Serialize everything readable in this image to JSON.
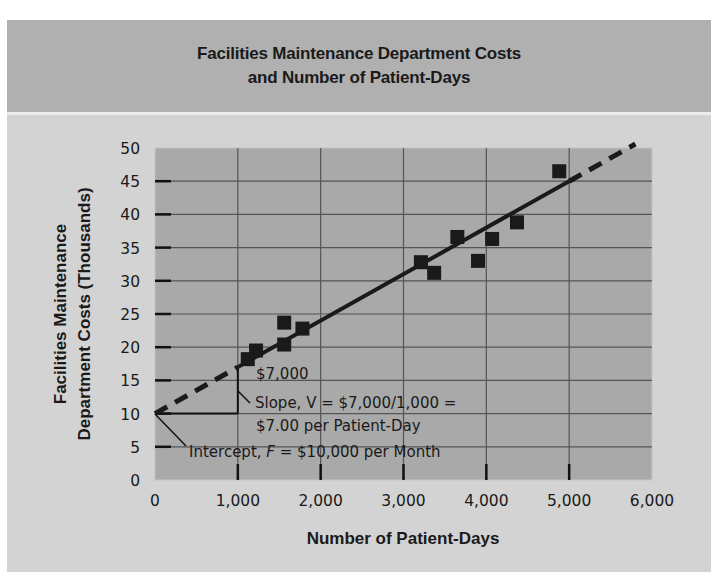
{
  "header": {
    "title_line1": "Facilities Maintenance Department Costs",
    "title_line2": "and Number of Patient-Days"
  },
  "axes": {
    "xlabel": "Number of Patient-Days",
    "ylabel_line1": "Facilities Maintenance",
    "ylabel_line2": "Department Costs (Thousands)",
    "x_ticks": [
      "0",
      "1,000",
      "2,000",
      "3,000",
      "4,000",
      "5,000",
      "6,000"
    ],
    "y_ticks": [
      "0",
      "5",
      "10",
      "15",
      "20",
      "25",
      "30",
      "35",
      "40",
      "45",
      "50"
    ]
  },
  "annotations": {
    "rise_label": "$7,000",
    "slope_line1": "Slope, V = $7,000/1,000 =",
    "slope_line2": "$7.00 per Patient-Day",
    "intercept_prefix": "Intercept, ",
    "intercept_var": "F",
    "intercept_suffix": " = $10,000 per Month"
  },
  "colors": {
    "panel_bg": "#d3d3d3",
    "title_bg": "#b0b0b0",
    "plot_bg": "#a9a9a9",
    "grid": "#555555",
    "marker": "#1a1a1a",
    "line": "#1a1a1a"
  },
  "chart_data": {
    "type": "scatter",
    "title": "Facilities Maintenance Department Costs and Number of Patient-Days",
    "xlabel": "Number of Patient-Days",
    "ylabel": "Facilities Maintenance Department Costs (Thousands)",
    "xlim": [
      0,
      6000
    ],
    "ylim": [
      0,
      50
    ],
    "x_ticks": [
      0,
      1000,
      2000,
      3000,
      4000,
      5000,
      6000
    ],
    "y_ticks": [
      0,
      5,
      10,
      15,
      20,
      25,
      30,
      35,
      40,
      45,
      50
    ],
    "grid": true,
    "series": [
      {
        "name": "Observed monthly costs",
        "marker": "square",
        "x": [
          1120,
          1220,
          1560,
          1560,
          1780,
          3210,
          3370,
          3650,
          3900,
          4070,
          4370,
          4880
        ],
        "y": [
          18.2,
          19.5,
          20.4,
          23.7,
          22.8,
          32.8,
          31.2,
          36.6,
          33.0,
          36.3,
          38.8,
          46.5
        ]
      },
      {
        "name": "Cost line (fitted)",
        "type": "line",
        "intercept": 10,
        "slope_per_1000": 7,
        "solid_range": [
          1000,
          5000
        ],
        "dashed_ranges": [
          [
            0,
            1000
          ],
          [
            5000,
            5800
          ]
        ]
      }
    ],
    "annotations": [
      {
        "text": "$7,000",
        "note": "rise of slope triangle from 1,000 patient-days"
      },
      {
        "text": "Slope, V = $7,000/1,000 = $7.00 per Patient-Day"
      },
      {
        "text": "Intercept, F = $10,000 per Month"
      }
    ]
  }
}
